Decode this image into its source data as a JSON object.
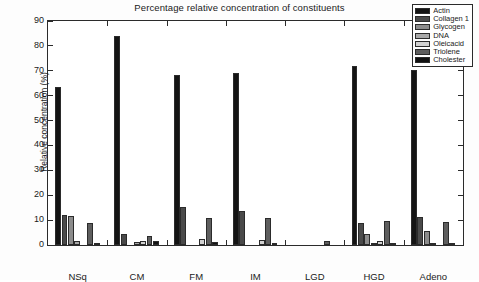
{
  "chart_data": {
    "type": "bar",
    "title": "Percentage relative concentration of constituents",
    "xlabel": "",
    "ylabel": "Relative concentration (%)",
    "ylim": [
      0,
      90
    ],
    "yticks": [
      0,
      10,
      20,
      30,
      40,
      50,
      60,
      70,
      80,
      90
    ],
    "grid": false,
    "legend_position": "top-right",
    "categories": [
      "NSq",
      "CM",
      "FM",
      "IM",
      "LGD",
      "HGD",
      "Adeno"
    ],
    "series": [
      {
        "name": "Actin",
        "color": "#141414",
        "values": [
          63.5,
          84.0,
          68.5,
          69.0,
          0.0,
          72.0,
          70.5
        ]
      },
      {
        "name": "Collagen 1",
        "color": "#4a4a4a",
        "values": [
          12.0,
          4.5,
          15.3,
          13.5,
          0.0,
          8.8,
          11.3
        ]
      },
      {
        "name": "Glycogen",
        "color": "#8c8c8c",
        "values": [
          11.5,
          0.0,
          0.0,
          0.0,
          0.0,
          4.6,
          5.6
        ]
      },
      {
        "name": "DNA",
        "color": "#a8a8a8",
        "values": [
          1.5,
          1.4,
          0.0,
          0.0,
          0.0,
          0.8,
          0.5
        ]
      },
      {
        "name": "Oleicacid",
        "color": "#d2d2d2",
        "values": [
          0.0,
          1.6,
          2.3,
          1.9,
          0.0,
          1.5,
          0.0
        ]
      },
      {
        "name": "Triolene",
        "color": "#5e5e5e",
        "values": [
          8.8,
          3.6,
          11.0,
          10.8,
          1.5,
          9.6,
          9.3
        ]
      },
      {
        "name": "Cholester",
        "color": "#121212",
        "values": [
          0.8,
          1.8,
          1.1,
          1.0,
          0.0,
          1.0,
          0.9
        ]
      }
    ]
  },
  "legend": {
    "entries": [
      {
        "label": "Actin"
      },
      {
        "label": "Collagen 1"
      },
      {
        "label": "Glycogen"
      },
      {
        "label": "DNA"
      },
      {
        "label": "Oleicacid"
      },
      {
        "label": "Triolene"
      },
      {
        "label": "Cholester"
      }
    ]
  }
}
